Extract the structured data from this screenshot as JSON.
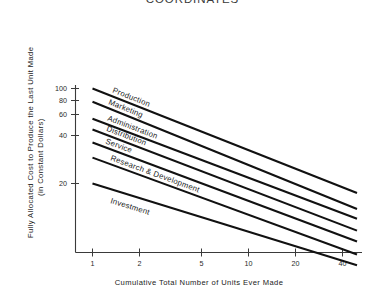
{
  "title": "COORDINATES",
  "axes": {
    "y_title_line1": "Fully  Allocated  Cost  to  Produce  the  Last  Unit  Made",
    "y_title_line2": "(in  Constant  Dollars)",
    "x_title": "Cumulative  Total  Number  of  Units  Ever  Made",
    "y_ticks": [
      "100",
      "80",
      "60",
      "40",
      "20"
    ],
    "x_ticks": [
      "1",
      "2",
      "5",
      "10",
      "20",
      "40"
    ]
  },
  "chart_data": {
    "type": "line",
    "title": "COORDINATES",
    "xlabel": "Cumulative Total Number of Units Ever Made",
    "ylabel": "Fully Allocated Cost to Produce the Last Unit Made (in Constant Dollars)",
    "xscale": "log",
    "yscale": "log",
    "xlim": [
      1,
      50
    ],
    "ylim": [
      4,
      110
    ],
    "xticks": [
      1,
      2,
      5,
      10,
      20,
      40
    ],
    "xticklabels": [
      "1",
      "2",
      "5",
      "10",
      "20",
      "40"
    ],
    "yticks": [
      20,
      40,
      60,
      80,
      100
    ],
    "yticklabels": [
      "20",
      "40",
      "60",
      "80",
      "100"
    ],
    "grid": false,
    "legend": "inline-labels",
    "x": [
      1,
      50
    ],
    "series": [
      {
        "name": "Production",
        "label_text": "Production",
        "values": [
          100,
          17
        ]
      },
      {
        "name": "Marketing",
        "label_text": "Marketing",
        "values": [
          80,
          13
        ]
      },
      {
        "name": "Administration",
        "label_text": "Administration",
        "values": [
          60,
          11
        ]
      },
      {
        "name": "Distribution",
        "label_text": "Distribution",
        "values": [
          50,
          9
        ]
      },
      {
        "name": "Service",
        "label_text": "Service",
        "values": [
          40,
          7.5
        ]
      },
      {
        "name": "Research & Development",
        "label_text": "Research  &  Development",
        "values": [
          31,
          6
        ]
      },
      {
        "name": "Investment",
        "label_text": "Investment",
        "values": [
          20,
          5
        ]
      }
    ]
  }
}
